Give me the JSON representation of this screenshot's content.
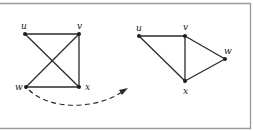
{
  "figure": {
    "left_graph": {
      "nodes": [
        {
          "id": "u",
          "label": "u",
          "x": 25,
          "y": 34,
          "lx": 21,
          "ly": 29
        },
        {
          "id": "v",
          "label": "v",
          "x": 79,
          "y": 34,
          "lx": 77,
          "ly": 29
        },
        {
          "id": "w",
          "label": "w",
          "x": 26,
          "y": 87,
          "lx": 15,
          "ly": 90
        },
        {
          "id": "x",
          "label": "x",
          "x": 79,
          "y": 87,
          "lx": 85,
          "ly": 90
        }
      ],
      "edges": [
        [
          "u",
          "v"
        ],
        [
          "u",
          "x"
        ],
        [
          "v",
          "w"
        ],
        [
          "v",
          "x"
        ],
        [
          "w",
          "x"
        ]
      ]
    },
    "right_graph": {
      "nodes": [
        {
          "id": "u",
          "label": "u",
          "x": 139,
          "y": 36,
          "lx": 136,
          "ly": 31
        },
        {
          "id": "v",
          "label": "v",
          "x": 185,
          "y": 36,
          "lx": 183,
          "ly": 30
        },
        {
          "id": "w",
          "label": "w",
          "x": 225,
          "y": 59,
          "lx": 224,
          "ly": 54
        },
        {
          "id": "x",
          "label": "x",
          "x": 185,
          "y": 81,
          "lx": 183,
          "ly": 94
        }
      ],
      "edges": [
        [
          "u",
          "v"
        ],
        [
          "u",
          "x"
        ],
        [
          "v",
          "w"
        ],
        [
          "v",
          "x"
        ],
        [
          "w",
          "x"
        ]
      ]
    },
    "transition_arrow": {
      "style": "dashed",
      "from": "w (left graph)",
      "to": "right graph"
    },
    "colors": {
      "stroke": "#2a2a2a",
      "frame": "#9a9a9a",
      "background": "#ffffff"
    }
  }
}
